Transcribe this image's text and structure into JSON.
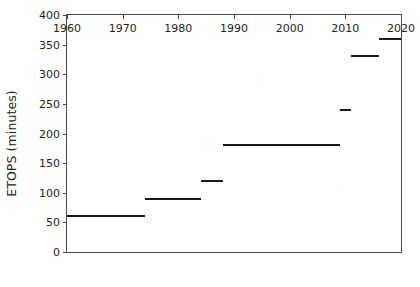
{
  "chart_data": {
    "type": "line",
    "subtype": "step",
    "title": "",
    "xlabel": "",
    "ylabel": "ETOPS (minutes)",
    "xlim": [
      1960,
      2020
    ],
    "ylim": [
      0,
      400
    ],
    "grid": false,
    "legend": null,
    "x_ticks": [
      1960,
      1970,
      1980,
      1990,
      2000,
      2010,
      2020
    ],
    "x_tick_labels": [
      "1960",
      "1970",
      "1980",
      "1990",
      "2000",
      "2010",
      "2020"
    ],
    "y_ticks": [
      0,
      50,
      100,
      150,
      200,
      250,
      300,
      350,
      400
    ],
    "y_tick_labels": [
      "0",
      "50",
      "100",
      "150",
      "200",
      "250",
      "300",
      "350",
      "400"
    ],
    "segments": [
      {
        "x_start": 1960,
        "x_end": 1974,
        "value": 60
      },
      {
        "x_start": 1974,
        "x_end": 1984,
        "value": 90
      },
      {
        "x_start": 1984,
        "x_end": 1988,
        "value": 120
      },
      {
        "x_start": 1988,
        "x_end": 2009,
        "value": 180
      },
      {
        "x_start": 2009,
        "x_end": 2011,
        "value": 240
      },
      {
        "x_start": 2011,
        "x_end": 2016,
        "value": 330
      },
      {
        "x_start": 2016,
        "x_end": 2020,
        "value": 360
      }
    ],
    "series": [
      {
        "name": "ETOPS limit",
        "x": [
          1960,
          1974,
          1984,
          1988,
          2009,
          2011,
          2016,
          2020
        ],
        "values": [
          60,
          90,
          120,
          180,
          240,
          330,
          360,
          360
        ]
      }
    ],
    "colors": {
      "line": "#1a1a1a",
      "axis": "#4d4d4d",
      "text": "#231f20",
      "background": "#ffffff"
    }
  }
}
